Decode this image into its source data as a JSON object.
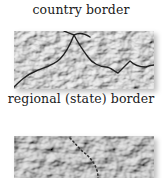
{
  "legend": {
    "items": [
      {
        "label": "country border",
        "line_style": "solid",
        "line_color": "#222222"
      },
      {
        "label": "regional (state) border",
        "line_style": "dotted",
        "line_color": "#333333"
      }
    ]
  },
  "colors": {
    "relief_light": "#e6e6e6",
    "relief_mid": "#bdbdbd",
    "relief_dark": "#8a8a8a"
  }
}
